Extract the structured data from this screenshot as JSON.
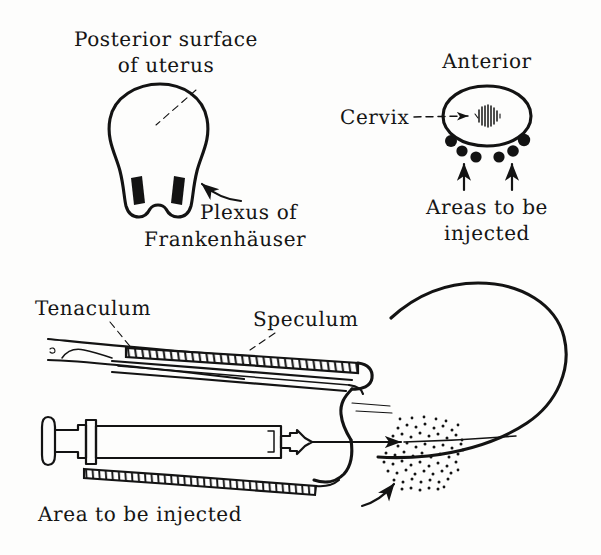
{
  "figure": {
    "background_color": "#fdfdfc",
    "ink_color": "#131313"
  },
  "panels": {
    "posterior_uterus": {
      "caption_line1": "Posterior surface",
      "caption_line2": "of uterus",
      "plexus_label_line1": "Plexus of",
      "plexus_label_line2": "Frankenhäuser",
      "marked_structures": 2
    },
    "cervix_view": {
      "title": "Anterior",
      "cervix_label": "Cervix",
      "injection_label_line1": "Areas to be",
      "injection_label_line2": "injected",
      "injection_site_count": 6,
      "arrow_count": 2
    },
    "procedure_view": {
      "tenaculum_label": "Tenaculum",
      "speculum_label": "Speculum",
      "injection_area_label": "Area to be injected",
      "stipple_dot_count": 120
    }
  },
  "icons": {
    "arrow": "arrow-icon",
    "leader": "leader-line-icon",
    "stipple": "stipple-icon",
    "hatching": "hatching-icon"
  }
}
